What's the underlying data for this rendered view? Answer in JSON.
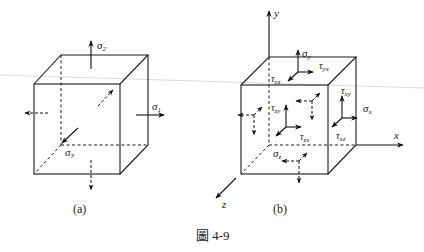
{
  "figure": {
    "caption": "圖 4-9",
    "caption_prefix": "圖",
    "caption_number": "4-9",
    "colors": {
      "line": "#1a1a1a",
      "background": "#ffffff",
      "scan_line": "#d8d8d8"
    }
  },
  "panel_a": {
    "label": "(a)",
    "stresses": [
      {
        "sym": "σ",
        "sub": "2",
        "direction": "up"
      },
      {
        "sym": "σ",
        "sub": "1",
        "direction": "right"
      },
      {
        "sym": "σ",
        "sub": "3",
        "direction": "out-of-page"
      }
    ]
  },
  "panel_b": {
    "label": "(b)",
    "axes": {
      "x": "x",
      "y": "y",
      "z": "z"
    },
    "normal_stresses": [
      {
        "sym": "σ",
        "sub": "y"
      },
      {
        "sym": "σ",
        "sub": "x"
      },
      {
        "sym": "σ",
        "sub": "z"
      }
    ],
    "shear_stresses": [
      {
        "sym": "τ",
        "sub": "yx"
      },
      {
        "sym": "τ",
        "sub": "yz"
      },
      {
        "sym": "τ",
        "sub": "xy"
      },
      {
        "sym": "τ",
        "sub": "xz"
      },
      {
        "sym": "τ",
        "sub": "zy"
      },
      {
        "sym": "τ",
        "sub": "zx"
      }
    ]
  }
}
